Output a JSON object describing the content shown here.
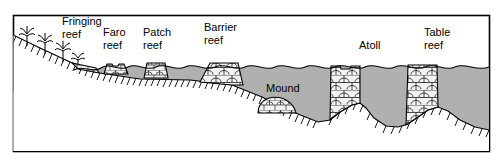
{
  "figure": {
    "title_visible": false,
    "type": "cross-section-diagram",
    "frame": {
      "border_color": "#000000",
      "background_color": "#ffffff",
      "x": 13,
      "y": 15,
      "width": 477,
      "height": 137
    },
    "colors": {
      "water": "#b0b0b0",
      "water_outline": "#000000",
      "reef_fill": "#f2f2f2",
      "reef_outline": "#000000",
      "land_fill": "#ffffff",
      "land_outline": "#000000",
      "hatch": "#000000",
      "plant": "#000000",
      "text": "#000000"
    }
  },
  "labels": [
    {
      "id": "fringing-reef",
      "text_line1": "Fringing",
      "text_line2": "reef",
      "x": 62,
      "y": 22,
      "anchor": "start"
    },
    {
      "id": "faro-reef",
      "text_line1": "Faro",
      "text_line2": "reef",
      "x": 103,
      "y": 33,
      "anchor": "start"
    },
    {
      "id": "patch-reef",
      "text_line1": "Patch",
      "text_line2": "reef",
      "x": 143,
      "y": 33,
      "anchor": "start"
    },
    {
      "id": "barrier-reef",
      "text_line1": "Barrier",
      "text_line2": "reef",
      "x": 204,
      "y": 28,
      "anchor": "start"
    },
    {
      "id": "mound",
      "text_line1": "Mound",
      "text_line2": "",
      "x": 266,
      "y": 89,
      "anchor": "start"
    },
    {
      "id": "atoll",
      "text_line1": "Atoll",
      "text_line2": "",
      "x": 359,
      "y": 46,
      "anchor": "start"
    },
    {
      "id": "table-reef",
      "text_line1": "Table",
      "text_line2": "reef",
      "x": 424,
      "y": 33,
      "anchor": "start"
    }
  ],
  "reef_features": [
    {
      "id": "fringing-reef",
      "name": "Fringing reef",
      "shape": "wedge-attached-to-shore",
      "position": "nearshore-slope"
    },
    {
      "id": "faro-reef",
      "name": "Faro reef",
      "shape": "small-trapezoid-with-lagoon-notch",
      "position": "shelf"
    },
    {
      "id": "patch-reef",
      "name": "Patch reef",
      "shape": "small-trapezoid",
      "position": "shelf"
    },
    {
      "id": "barrier-reef",
      "name": "Barrier reef",
      "shape": "broad-trapezoid-shelf-edge",
      "position": "shelf-edge"
    },
    {
      "id": "mound",
      "name": "Mound",
      "shape": "half-dome-on-slope",
      "position": "deep-slope"
    },
    {
      "id": "atoll",
      "name": "Atoll",
      "shape": "tall-column-with-central-lagoon-notch",
      "position": "deep-basin"
    },
    {
      "id": "table-reef",
      "name": "Table reef",
      "shape": "tall-flat-topped-column",
      "position": "deep-basin"
    }
  ],
  "legend_note": {
    "sea_level_line": "wavy water surface",
    "substrate_marker": "hatched basement rock line",
    "reef_texture": "coral brick / arch pattern"
  }
}
